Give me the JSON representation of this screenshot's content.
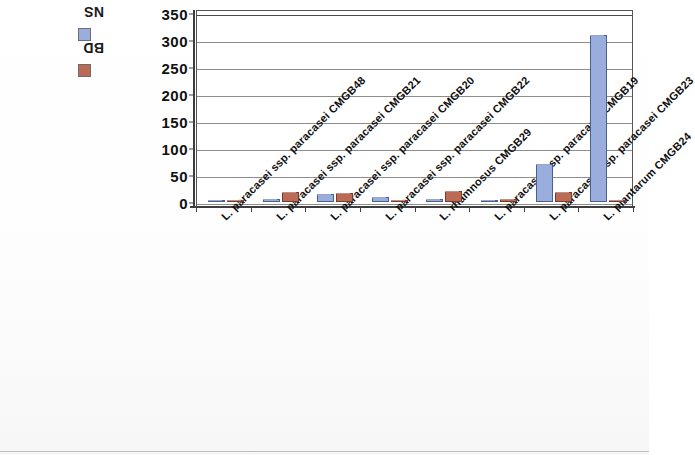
{
  "chart_data": {
    "type": "bar",
    "title": "",
    "xlabel": "",
    "ylabel": "",
    "ylim": [
      0,
      350
    ],
    "ytick_step": 50,
    "yticks": [
      "350",
      "300",
      "250",
      "200",
      "150",
      "100",
      "50",
      "0"
    ],
    "grid": true,
    "legend_position": "left",
    "categories": [
      "L. paracasei ssp. paracasei CMGB48",
      "L. paracasei ssp. paracasei CMGB21",
      "L. paracasei ssp. paracasei CMGB20",
      "L. paracasei ssp. paracasei CMGB22",
      "L. rhamnosus CMGB29",
      "L. paracasei ssp. paracasei CMGB19",
      "L. paracasei ssp. paracasei CMGB23",
      "L. plantarum CMGB24"
    ],
    "series": [
      {
        "name": "NS",
        "color": "#9aaede",
        "values": [
          4,
          5,
          14,
          9,
          6,
          4,
          70,
          310
        ]
      },
      {
        "name": "BD",
        "color": "#bb6a55",
        "values": [
          3,
          18,
          16,
          3,
          20,
          5,
          18,
          3
        ]
      }
    ]
  },
  "legend": {
    "items": [
      {
        "label": "NS",
        "color": "#9aaede"
      },
      {
        "label": "BD",
        "color": "#bb6a55"
      }
    ]
  },
  "axes": {
    "y": {
      "ticks": [
        "350",
        "300",
        "250",
        "200",
        "150",
        "100",
        "50",
        "0"
      ]
    }
  }
}
